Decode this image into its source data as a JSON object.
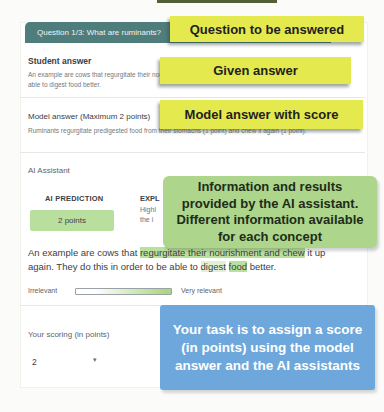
{
  "question": {
    "bar_label": "Question 1/3: What are ruminants?"
  },
  "student_answer": {
    "heading": "Student answer",
    "line1": "An example are cows that regurgitate their nou",
    "line2": "able to digest food better."
  },
  "model_answer": {
    "heading": "Model answer (Maximum 2 points)",
    "text": "Ruminants regurgitate predigested food from their stomachs (1 point) and chew it again (1 point)."
  },
  "ai_assistant": {
    "heading": "AI Assistant",
    "prediction": {
      "label": "AI PREDICTION",
      "value": "2 points"
    },
    "explanation": {
      "label_fragment": "EXPL",
      "line_fragment_1": "Highl",
      "line_fragment_2": "the i"
    },
    "student_answer_segments": [
      {
        "text": "An example are cows that ",
        "highlight": "none"
      },
      {
        "text": "regurgitate their nourishment and chew",
        "highlight": "strong"
      },
      {
        "text": " it up again. They do this in order to be able to ",
        "highlight": "none"
      },
      {
        "text": "digest",
        "highlight": "light"
      },
      {
        "text": " ",
        "highlight": "none"
      },
      {
        "text": "food",
        "highlight": "strong"
      },
      {
        "text": " better.",
        "highlight": "none"
      }
    ],
    "relevance": {
      "left_label": "Irrelevant",
      "right_label": "Very relevant"
    }
  },
  "scoring": {
    "label": "Your scoring (in points)",
    "selected_value": "2",
    "dropdown_icon": "▾"
  },
  "annotations": {
    "question": "Question to be answered",
    "given_answer": "Given answer",
    "model_answer": "Model answer with score",
    "ai_info": "Information and results provided by the AI assistant. Different information available for each concept",
    "task": "Your task is to assign a score (in points) using the model answer and the AI assistants"
  },
  "colors": {
    "question_bar_bg": "#4e7d7b",
    "annotation_yellow": "#e4e94e",
    "annotation_green": "#aed58c",
    "annotation_blue": "#6ea7dc",
    "prediction_pill_bg": "#b8df9d",
    "text_highlight_strong": "#b9e09c",
    "text_highlight_light": "#e2f1d2",
    "relevance_gradient_end": "#a9d87e"
  }
}
